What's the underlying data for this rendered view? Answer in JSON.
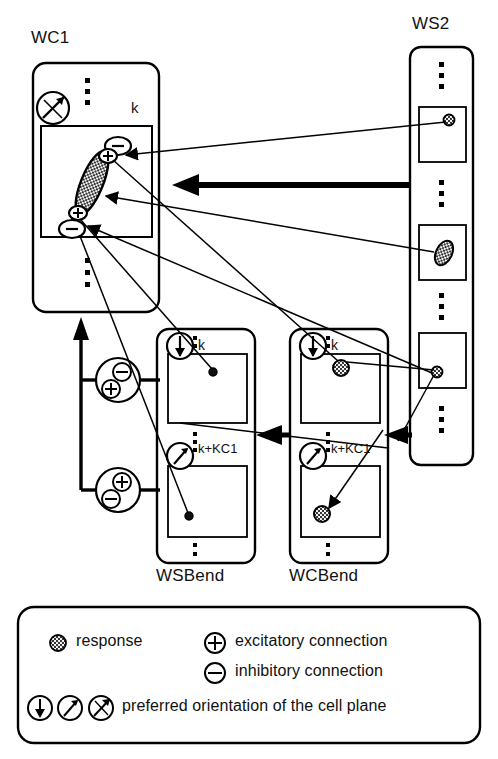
{
  "figure": {
    "type": "neural-network-architecture-diagram",
    "background_color": "#ffffff",
    "stroke_color": "#000000",
    "fill_pattern_color": "#3a3a3a"
  },
  "panels": [
    {
      "id": "wc1",
      "title": "WC1",
      "title_position": "above-left",
      "orientation_icon": "orientation-diagonal-up-right",
      "plane_index_label": "k"
    },
    {
      "id": "ws2",
      "title": "WS2",
      "title_position": "above-center",
      "cells": [
        "response-dot",
        "response-ellipse",
        "response-dot"
      ]
    },
    {
      "id": "wsbend",
      "title": "WSBend",
      "title_position": "below-center",
      "layers": [
        {
          "orientation_icon": "orientation-down",
          "label": "k"
        },
        {
          "orientation_icon": "orientation-up-right",
          "label": "k+KC1"
        }
      ]
    },
    {
      "id": "wcbend",
      "title": "WCBend",
      "title_position": "below-center",
      "layers": [
        {
          "orientation_icon": "orientation-down",
          "label": "k"
        },
        {
          "orientation_icon": "orientation-up-right",
          "label": "k+KC1"
        }
      ]
    }
  ],
  "labels": {
    "wc1_title": "WC1",
    "ws2_title": "WS2",
    "wsbend_title": "WSBend",
    "wcbend_title": "WCBend",
    "wc1_k": "k",
    "wsbend_k": "k",
    "wsbend_kplus": "k+KC1",
    "wcbend_k": "k",
    "wcbend_kplus": "k+KC1"
  },
  "connection_nodes": {
    "wc1_inner": [
      {
        "sign": "-",
        "shape": "ellipse",
        "position": "top"
      },
      {
        "sign": "+",
        "shape": "ellipse",
        "position": "upper-mid"
      },
      {
        "sign": "+",
        "shape": "ellipse",
        "position": "lower-mid"
      },
      {
        "sign": "-",
        "shape": "ellipse",
        "position": "bottom"
      }
    ],
    "left_chain": [
      {
        "signs": [
          "-",
          "+"
        ],
        "position": "upper"
      },
      {
        "signs": [
          "+",
          "-"
        ],
        "position": "lower"
      }
    ]
  },
  "legend": {
    "items": [
      {
        "icon": "response-dot-icon",
        "label": "response"
      },
      {
        "icon": "plus-circle-icon",
        "label": "excitatory connection"
      },
      {
        "icon": "minus-circle-icon",
        "label": "inhibitory connection"
      },
      {
        "icon": "orientation-icons",
        "label": "preferred orientation of the cell plane"
      }
    ]
  }
}
